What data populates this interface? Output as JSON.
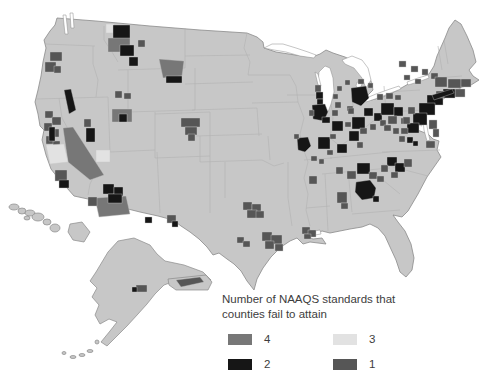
{
  "legend": {
    "title": "Number of NAAQS standards that counties fail to attain",
    "items": [
      {
        "label": "4",
        "color": "#777777"
      },
      {
        "label": "3",
        "color": "#e2e2e2"
      },
      {
        "label": "2",
        "color": "#161616"
      },
      {
        "label": "1",
        "color": "#565656"
      }
    ]
  },
  "map": {
    "colors": {
      "land": "#c7c7c7",
      "water": "#ffffff",
      "state_border": "#b2b2b2",
      "outline": "#8a8a8a"
    }
  }
}
